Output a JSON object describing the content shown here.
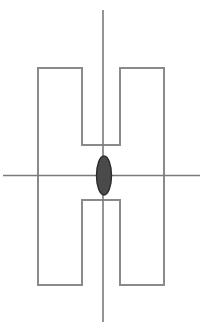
{
  "figure": {
    "canvas": {
      "width": 205,
      "height": 335,
      "background": "#ffffff"
    },
    "colors": {
      "outline": "#8a8a8a",
      "axis": "#7a7a7a",
      "ellipse_fill": "#4a4a4a",
      "ellipse_stroke": "#2b2b2b",
      "background": "#ffffff"
    },
    "stroke_widths": {
      "outline": 2,
      "axis": 1.6,
      "ellipse": 1.4
    },
    "h_shape": {
      "name": "h-outline",
      "left_leg_x": [
        38,
        82
      ],
      "right_leg_x": [
        120,
        164
      ],
      "top_y": 68,
      "bottom_y": 285,
      "notch_top_y": 145,
      "notch_bottom_y": 200,
      "path": "M 38 68 L 82 68 L 82 145 L 120 145 L 120 68 L 164 68 L 164 285 L 120 285 L 120 200 L 82 200 L 82 285 L 38 285 Z"
    },
    "vertical_axis": {
      "name": "vertical-axis-line",
      "x": 103,
      "y_start": 10,
      "y_end": 322
    },
    "horizontal_axis": {
      "name": "horizontal-axis-line",
      "y": 175.5,
      "x_start": 3,
      "x_end": 200
    },
    "ellipse": {
      "name": "center-ellipse",
      "cx": 104,
      "cy": 175.5,
      "rx": 7.5,
      "ry": 19.5
    }
  }
}
